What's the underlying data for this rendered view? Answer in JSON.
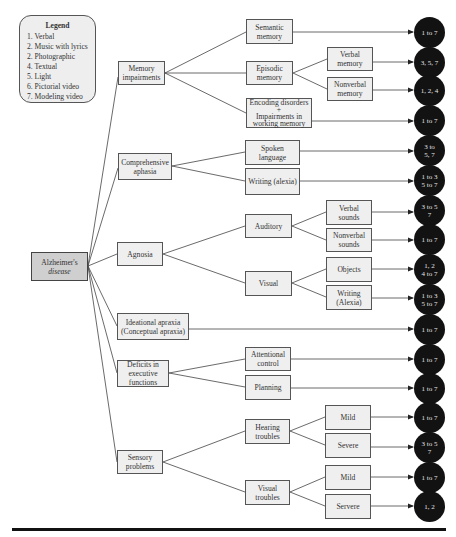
{
  "legend": {
    "title": "Legend",
    "items": [
      "1. Verbal",
      "2. Music with lyrics",
      "2. Photographic",
      "4. Textual",
      "5. Light",
      "6. Pictorial video",
      "7. Modeling video"
    ]
  },
  "root": {
    "label": "Alzheimer's disease",
    "lines": [
      "Alzheimer's",
      "disease"
    ]
  },
  "categories": [
    {
      "id": "memory",
      "lines": [
        "Memory",
        "impairments"
      ]
    },
    {
      "id": "aphasia",
      "lines": [
        "Comprehensive",
        "aphasia"
      ]
    },
    {
      "id": "agnosia",
      "lines": [
        "Agnosia"
      ]
    },
    {
      "id": "apraxia",
      "lines": [
        "Ideational apraxia",
        "(Conceptual apraxia)"
      ]
    },
    {
      "id": "executive",
      "lines": [
        "Deficits in",
        "executive",
        "functions"
      ]
    },
    {
      "id": "sensory",
      "lines": [
        "Sensory",
        "problems"
      ]
    }
  ],
  "subcategories": [
    {
      "id": "semantic",
      "lines": [
        "Semantic",
        "memory"
      ]
    },
    {
      "id": "episodic",
      "lines": [
        "Episodic",
        "memory"
      ]
    },
    {
      "id": "encoding",
      "lines": [
        "Encoding disorders",
        "+",
        "Impairments in",
        "working memory"
      ]
    },
    {
      "id": "spoken",
      "lines": [
        "Spoken",
        "language"
      ]
    },
    {
      "id": "writing_alexia",
      "lines": [
        "Writing (alexia)"
      ]
    },
    {
      "id": "auditory",
      "lines": [
        "Auditory"
      ]
    },
    {
      "id": "visual",
      "lines": [
        "Visual"
      ]
    },
    {
      "id": "attentional",
      "lines": [
        "Attentional",
        "control"
      ]
    },
    {
      "id": "planning",
      "lines": [
        "Planning"
      ]
    },
    {
      "id": "hearing",
      "lines": [
        "Hearing",
        "troubles"
      ]
    },
    {
      "id": "visual_troubles",
      "lines": [
        "Visual",
        "troubles"
      ]
    }
  ],
  "leaves": [
    {
      "id": "verbal_memory",
      "lines": [
        "Verbal",
        "memory"
      ]
    },
    {
      "id": "nonverbal_memory",
      "lines": [
        "Nonverbal",
        "memory"
      ]
    },
    {
      "id": "verbal_sounds",
      "lines": [
        "Verbal",
        "sounds"
      ]
    },
    {
      "id": "nonverbal_sounds",
      "lines": [
        "Nonverbal",
        "sounds"
      ]
    },
    {
      "id": "objects",
      "lines": [
        "Objects"
      ]
    },
    {
      "id": "writing_Alexia",
      "lines": [
        "Writing",
        "(Alexia)"
      ]
    },
    {
      "id": "mild_hearing",
      "lines": [
        "Mild"
      ]
    },
    {
      "id": "severe_hearing",
      "lines": [
        "Severe"
      ]
    },
    {
      "id": "mild_visual",
      "lines": [
        "Mild"
      ]
    },
    {
      "id": "severe_visual",
      "lines": [
        "Servere"
      ]
    }
  ],
  "outcomes": [
    {
      "from": "semantic",
      "lines": [
        "1 to 7"
      ]
    },
    {
      "from": "verbal_memory",
      "lines": [
        "3, 5, 7"
      ]
    },
    {
      "from": "nonverbal_memory",
      "lines": [
        "1, 2, 4"
      ]
    },
    {
      "from": "encoding",
      "lines": [
        "1 to 7"
      ]
    },
    {
      "from": "spoken",
      "lines": [
        "3 to",
        "5, 7"
      ]
    },
    {
      "from": "writing_alexia",
      "lines": [
        "1 to 3",
        "5 to 7"
      ]
    },
    {
      "from": "verbal_sounds",
      "lines": [
        "3 to 5",
        "7"
      ]
    },
    {
      "from": "nonverbal_sounds",
      "lines": [
        "1 to 7"
      ]
    },
    {
      "from": "objects",
      "lines": [
        "1, 2",
        "4 to 7"
      ]
    },
    {
      "from": "writing_Alexia",
      "lines": [
        "1 to 3",
        "5 to 7"
      ]
    },
    {
      "from": "apraxia",
      "lines": [
        "1 to 7"
      ]
    },
    {
      "from": "attentional",
      "lines": [
        "1 to 7"
      ]
    },
    {
      "from": "planning",
      "lines": [
        "1 to 7"
      ]
    },
    {
      "from": "mild_hearing",
      "lines": [
        "1 to 7"
      ]
    },
    {
      "from": "severe_hearing",
      "lines": [
        "3 to 5",
        "7"
      ]
    },
    {
      "from": "mild_visual",
      "lines": [
        "1 to 7"
      ]
    },
    {
      "from": "severe_visual",
      "lines": [
        "1, 2"
      ]
    }
  ],
  "colors": {
    "node_fill": "#efefef",
    "root_fill": "#cfcfcf",
    "outcome_fill": "#121212",
    "line": "#444444"
  }
}
